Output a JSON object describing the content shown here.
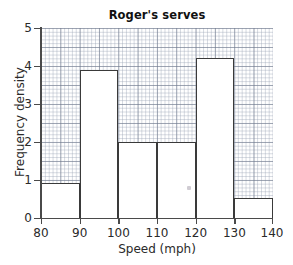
{
  "chart_data": {
    "type": "bar",
    "title": "Roger's serves",
    "xlabel": "Speed (mph)",
    "ylabel": "Frequency density",
    "xlim": [
      80,
      140
    ],
    "ylim": [
      0,
      5
    ],
    "xticks": [
      "80",
      "90",
      "100",
      "110",
      "120",
      "130",
      "140"
    ],
    "yticks": [
      "0",
      "1",
      "2",
      "3",
      "4",
      "5"
    ],
    "grid": "graph-paper",
    "legend": "none",
    "bins": [
      {
        "label": "80-90",
        "start": 80,
        "end": 90,
        "value": 0.92
      },
      {
        "label": "90-100",
        "start": 90,
        "end": 100,
        "value": 3.9
      },
      {
        "label": "100-110",
        "start": 100,
        "end": 110,
        "value": 2.0
      },
      {
        "label": "110-120",
        "start": 110,
        "end": 120,
        "value": 2.0
      },
      {
        "label": "120-130",
        "start": 120,
        "end": 130,
        "value": 4.2
      },
      {
        "label": "130-140",
        "start": 130,
        "end": 140,
        "value": 0.52
      }
    ],
    "categories": [
      "80-90",
      "90-100",
      "100-110",
      "110-120",
      "120-130",
      "130-140"
    ],
    "values": [
      0.92,
      3.9,
      2.0,
      2.0,
      4.2,
      0.52
    ],
    "colors": {
      "bar_fill": "#ffffff",
      "bar_edge": "#3a3a3a",
      "axis": "#4a4a4a",
      "grid_major": "#6e788c",
      "grid_minor": "#96a0b2",
      "text": "#2a2a2a",
      "background": "#ffffff"
    }
  }
}
